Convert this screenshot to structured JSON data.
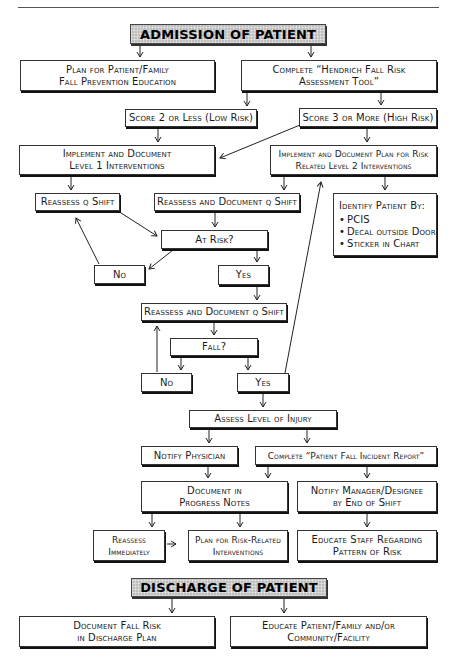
{
  "diagram": {
    "banners": {
      "admission": "ADMISSION OF PATIENT",
      "discharge": "DISCHARGE OF PATIENT"
    },
    "nodes": {
      "plan_education": [
        "Plan for Patient/Family",
        "Fall Prevention Education"
      ],
      "complete_hendrich": [
        "Complete “Hendrich Fall Risk",
        "Assessment Tool”"
      ],
      "score_low": "Score 2 or Less (Low Risk)",
      "score_high": "Score 3 or More (High Risk)",
      "implement_level1": [
        "Implement and Document",
        "Level 1 Interventions"
      ],
      "implement_level2": [
        "Implement and Document Plan for Risk",
        "Related Level 2 Interventions"
      ],
      "reassess_q_shift": "Reassess q Shift",
      "reassess_document_1": "Reassess and Document q Shift",
      "identify_patient": {
        "title": "Identify Patient By:",
        "items": [
          "PCIS",
          "Decal outside Door",
          "Sticker in Chart"
        ]
      },
      "at_risk": "At Risk?",
      "no_1": "No",
      "yes_1": "Yes",
      "reassess_document_2": "Reassess and Document q Shift",
      "fall": "Fall?",
      "no_2": "No",
      "yes_2": "Yes",
      "assess_injury": "Assess Level of Injury",
      "notify_physician": "Notify Physician",
      "complete_incident": "Complete “Patient Fall Incident Report”",
      "document_progress": [
        "Document in",
        "Progress Notes"
      ],
      "notify_manager": [
        "Notify Manager/Designee",
        "by End of Shift"
      ],
      "reassess_immediately": [
        "Reassess",
        "Immediately"
      ],
      "plan_risk_related": [
        "Plan for Risk-Related",
        "Interventions"
      ],
      "educate_staff": [
        "Educate Staff Regarding",
        "Pattern of Risk"
      ],
      "document_discharge": [
        "Document Fall Risk",
        "in Discharge Plan"
      ],
      "educate_patient": [
        "Educate Patient/Family and/or",
        "Community/Facility"
      ]
    }
  }
}
